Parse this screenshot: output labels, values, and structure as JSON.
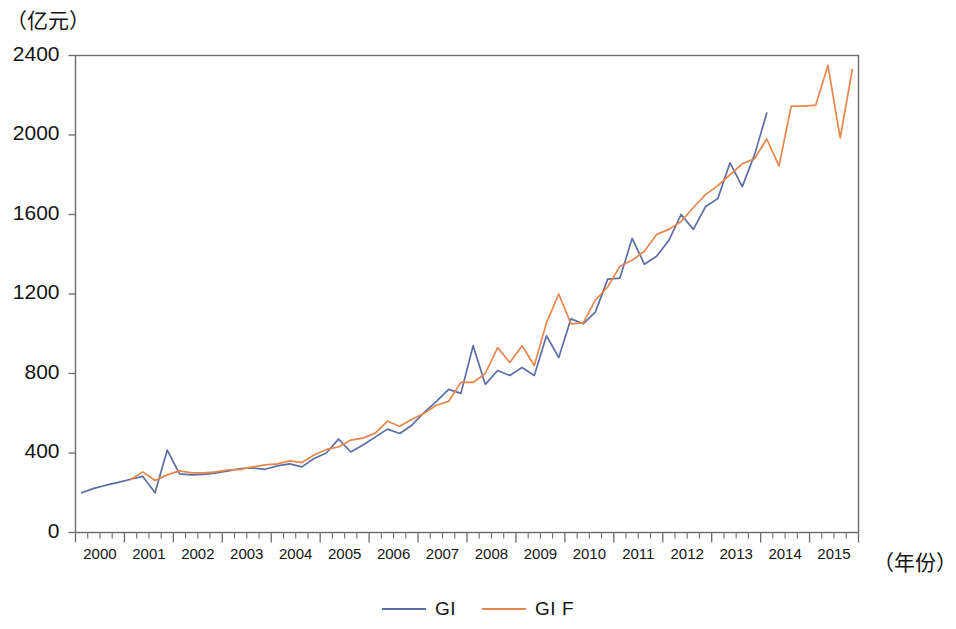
{
  "chart_data": {
    "type": "line",
    "title": "",
    "subtitle": "",
    "xlabel": "（年份）",
    "ylabel": "（亿元）",
    "y_unit_label": "（亿元）",
    "x_unit_label": "（年份）",
    "grid": false,
    "legend_position": "bottom-center",
    "ylim": [
      0,
      2400
    ],
    "y_ticks": [
      0,
      400,
      800,
      1200,
      1600,
      2000,
      2400
    ],
    "y_tick_labels": [
      "0",
      "400",
      "800",
      "1200",
      "1600",
      "2000",
      "2400"
    ],
    "xlim": [
      "1999Q4",
      "2015Q4"
    ],
    "x_tick_labels": [
      "2000",
      "2001",
      "2002",
      "2003",
      "2004",
      "2005",
      "2006",
      "2007",
      "2008",
      "2009",
      "2010",
      "2011",
      "2012",
      "2013",
      "2014",
      "2015"
    ],
    "x_minor_ticks_per_year": 4,
    "x": [
      "2000Q1",
      "2000Q2",
      "2000Q3",
      "2000Q4",
      "2001Q1",
      "2001Q2",
      "2001Q3",
      "2001Q4",
      "2002Q1",
      "2002Q2",
      "2002Q3",
      "2002Q4",
      "2003Q1",
      "2003Q2",
      "2003Q3",
      "2003Q4",
      "2004Q1",
      "2004Q2",
      "2004Q3",
      "2004Q4",
      "2005Q1",
      "2005Q2",
      "2005Q3",
      "2005Q4",
      "2006Q1",
      "2006Q2",
      "2006Q3",
      "2006Q4",
      "2007Q1",
      "2007Q2",
      "2007Q3",
      "2007Q4",
      "2008Q1",
      "2008Q2",
      "2008Q3",
      "2008Q4",
      "2009Q1",
      "2009Q2",
      "2009Q3",
      "2009Q4",
      "2010Q1",
      "2010Q2",
      "2010Q3",
      "2010Q4",
      "2011Q1",
      "2011Q2",
      "2011Q3",
      "2011Q4",
      "2012Q1",
      "2012Q2",
      "2012Q3",
      "2012Q4",
      "2013Q1",
      "2013Q2",
      "2013Q3",
      "2013Q4",
      "2014Q1",
      "2014Q2",
      "2014Q3",
      "2014Q4",
      "2015Q1",
      "2015Q2",
      "2015Q3",
      "2015Q4"
    ],
    "series": [
      {
        "name": "GI",
        "color": "#5c6ea6",
        "style": "solid",
        "values": [
          200,
          222,
          238,
          252,
          268,
          282,
          200,
          415,
          295,
          290,
          292,
          300,
          310,
          322,
          325,
          318,
          335,
          345,
          330,
          372,
          400,
          470,
          405,
          440,
          480,
          520,
          498,
          540,
          605,
          660,
          720,
          700,
          940,
          745,
          815,
          790,
          830,
          790,
          990,
          880,
          1075,
          1050,
          1110,
          1275,
          1280,
          1480,
          1350,
          1390,
          1470,
          1600,
          1525,
          1640,
          1680,
          1860,
          1740,
          1900,
          2110,
          null,
          null,
          null,
          null,
          null,
          null,
          null
        ]
      },
      {
        "name": "GI F",
        "color": "#e8864c",
        "style": "solid",
        "values": [
          null,
          null,
          null,
          null,
          265,
          305,
          262,
          290,
          310,
          300,
          300,
          305,
          315,
          318,
          330,
          340,
          345,
          360,
          352,
          390,
          418,
          430,
          465,
          475,
          500,
          560,
          535,
          570,
          600,
          640,
          660,
          755,
          755,
          800,
          930,
          855,
          940,
          840,
          1055,
          1200,
          1050,
          1055,
          1170,
          1235,
          1340,
          1370,
          1415,
          1500,
          1525,
          1565,
          1635,
          1700,
          1745,
          1800,
          1855,
          1880,
          1980,
          1845,
          2145,
          2145,
          2150,
          2350,
          1985,
          2330
        ]
      }
    ]
  },
  "legend": {
    "entries": [
      {
        "label": "GI",
        "color": "#5c6ea6"
      },
      {
        "label": "GI  F",
        "color": "#e8864c"
      }
    ]
  }
}
